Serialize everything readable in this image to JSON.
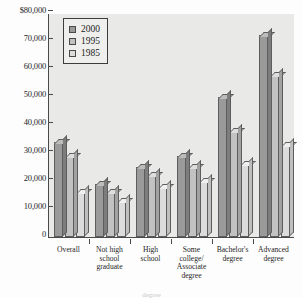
{
  "chart_data": {
    "type": "bar",
    "title": "",
    "xlabel": "",
    "ylabel": "",
    "ylim": [
      0,
      80000
    ],
    "ytick_values": [
      0,
      10000,
      20000,
      30000,
      40000,
      50000,
      60000,
      70000,
      80000
    ],
    "ytick_labels": [
      "0",
      "10,000",
      "20,000",
      "30,000",
      "40,000",
      "50,000",
      "60,000",
      "70,000",
      "$80,000"
    ],
    "grid": false,
    "legend_position": "top-left",
    "categories": [
      "Overall",
      "Not high school graduate",
      "High school",
      "Some college/ Associate degree",
      "Bachelor's degree",
      "Advanced degree"
    ],
    "category_label_lines": [
      [
        "Overall"
      ],
      [
        "Not high",
        "school",
        "graduate"
      ],
      [
        "High",
        "school"
      ],
      [
        "Some",
        "college/",
        "Associate",
        "degree"
      ],
      [
        "Bachelor's",
        "degree"
      ],
      [
        "Advanced",
        "degree"
      ]
    ],
    "series": [
      {
        "name": "2000",
        "color": "#9a9a9a",
        "values": [
          34000,
          19000,
          25000,
          29000,
          50000,
          72000
        ]
      },
      {
        "name": "1995",
        "color": "#c2c2c2",
        "values": [
          29000,
          16000,
          22000,
          25000,
          38000,
          58000
        ]
      },
      {
        "name": "1985",
        "color": "#dcdcdc",
        "values": [
          16000,
          13000,
          18000,
          20000,
          26000,
          33000
        ]
      }
    ]
  },
  "legend": {
    "entries": [
      {
        "label": "2000"
      },
      {
        "label": "1995"
      },
      {
        "label": "1985"
      }
    ]
  },
  "footer": {
    "cut_off_text": "degree"
  }
}
